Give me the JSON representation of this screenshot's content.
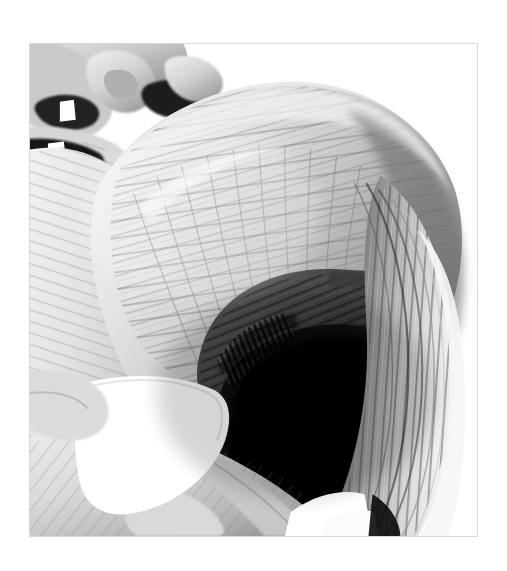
{
  "page": {
    "background_color": "#ffffff",
    "width": 507,
    "height": 571
  },
  "plate": {
    "title": "Gluteal region deep dissection",
    "frame_color": "#d8d8d8",
    "frame_x": 29,
    "frame_y": 43,
    "frame_width": 449,
    "frame_height": 494,
    "medium": "grayscale anatomical rendering",
    "view": "posterolateral oblique",
    "palette": {
      "paper_white": "#ffffff",
      "bone_highlight": "#fdfdfd",
      "light_fiber": "#e2e2e2",
      "mid_fiber": "#b6b6b6",
      "mid_dark_fiber": "#8d8d8d",
      "shadow_gray": "#595959",
      "deep_shadow": "#2b2b2b",
      "core_black": "#050505",
      "outline_gray": "#7a7a7a"
    },
    "regions": [
      {
        "name": "sacral-vertebrae",
        "label": "Sacral vertebrae and foramina",
        "position": "top-left",
        "tone": "mid gray with dark foramina and white highlights"
      },
      {
        "name": "gluteus-medius-fan",
        "label": "Fan-shaped superficial gluteal muscle",
        "position": "upper-center",
        "tone": "light gray with radiating striations"
      },
      {
        "name": "deep-muscle-shadow",
        "label": "Deep shadowed muscle cavity",
        "position": "center",
        "tone": "near black"
      },
      {
        "name": "lateral-fiber-bundles",
        "label": "Vertical lateral fiber bundles",
        "position": "right",
        "tone": "banded light and mid gray"
      },
      {
        "name": "greater-sciatic-notch",
        "label": "Bright bone wedge / notch",
        "position": "lower-left",
        "tone": "pure white"
      },
      {
        "name": "ischial-ramus",
        "label": "Lower bone and muscle sheet",
        "position": "bottom-left",
        "tone": "light gray"
      },
      {
        "name": "inferior-highlight",
        "label": "Inferior bright highlight",
        "position": "bottom-center-right",
        "tone": "white"
      }
    ]
  }
}
